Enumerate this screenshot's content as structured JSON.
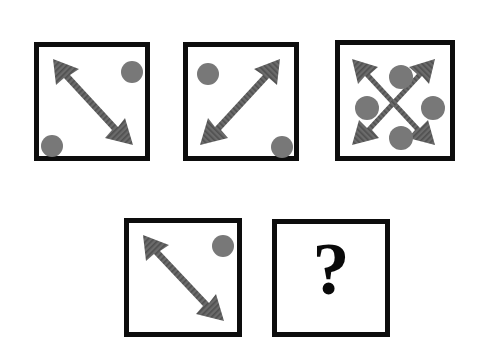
{
  "puzzle": {
    "type": "matrix-reasoning-puzzle",
    "background_color": "#ffffff",
    "panel_border_color": "#0d0d0d",
    "arrow_color": "#6b6b6b",
    "dot_color": "#787878",
    "question_color": "#0a0a0a",
    "question_mark": "?",
    "rows": [
      {
        "row_name": "top-row",
        "panels": [
          {
            "id": "panel-1",
            "label": "panel-1",
            "x": 34,
            "y": 42,
            "w": 116,
            "h": 119,
            "arrows": [
              "double-arrow-nw-se"
            ],
            "dots": [
              {
                "name": "dot-top-right",
                "cx": 128,
                "cy": 68,
                "r": 11
              },
              {
                "name": "dot-bottom-left",
                "cx": 47,
                "cy": 141,
                "r": 11
              }
            ]
          },
          {
            "id": "panel-2",
            "label": "panel-2",
            "x": 183,
            "y": 42,
            "w": 116,
            "h": 119,
            "arrows": [
              "double-arrow-sw-ne"
            ],
            "dots": [
              {
                "name": "dot-top-left",
                "cx": 203,
                "cy": 69,
                "r": 11
              },
              {
                "name": "dot-bottom-right",
                "cx": 277,
                "cy": 142,
                "r": 11
              }
            ]
          },
          {
            "id": "panel-3",
            "label": "panel-3",
            "x": 335,
            "y": 40,
            "w": 120,
            "h": 121,
            "arrows": [
              "double-arrow-nw-se",
              "double-arrow-sw-ne"
            ],
            "dots": [
              {
                "name": "dot-top",
                "cx": 396,
                "cy": 72,
                "r": 12
              },
              {
                "name": "dot-right",
                "cx": 428,
                "cy": 103,
                "r": 12
              },
              {
                "name": "dot-bottom",
                "cx": 396,
                "cy": 133,
                "r": 12
              },
              {
                "name": "dot-left",
                "cx": 362,
                "cy": 103,
                "r": 12
              }
            ]
          }
        ]
      },
      {
        "row_name": "bottom-row",
        "panels": [
          {
            "id": "panel-4",
            "label": "panel-4",
            "x": 124,
            "y": 218,
            "w": 118,
            "h": 119,
            "arrows": [
              "double-arrow-nw-se"
            ],
            "dots": [
              {
                "name": "dot-top-right",
                "cx": 218,
                "cy": 241,
                "r": 11
              }
            ]
          },
          {
            "id": "panel-5-answer",
            "label": "panel-5-answer",
            "x": 272,
            "y": 219,
            "w": 118,
            "h": 118,
            "arrows": [],
            "dots": [],
            "content": "question-mark"
          }
        ]
      }
    ]
  }
}
